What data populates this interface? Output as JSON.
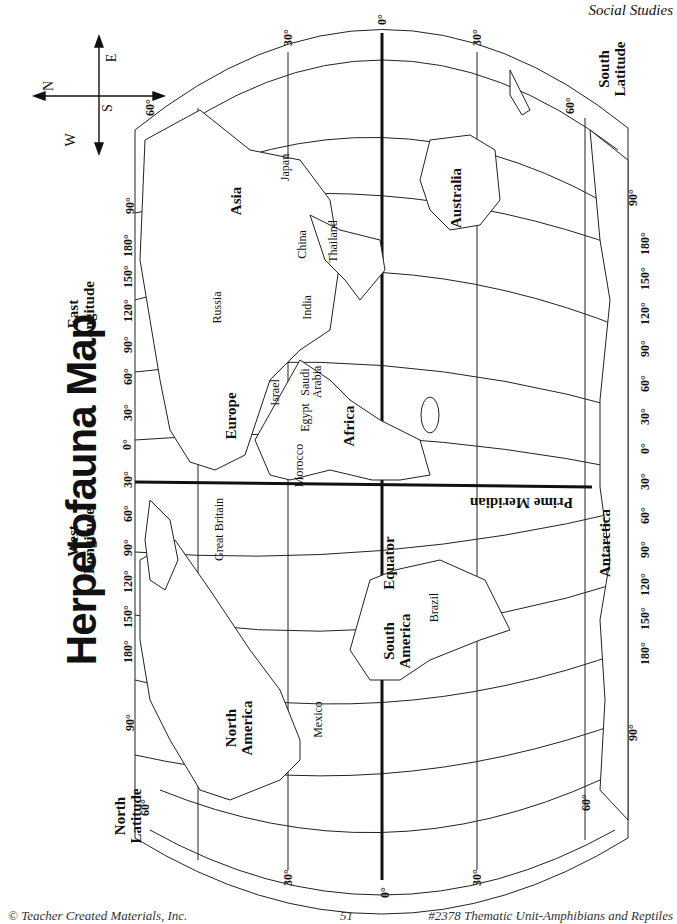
{
  "header": {
    "section": "Social Studies"
  },
  "title": "Herpetofauna Map",
  "compass": {
    "north": "N",
    "south": "S",
    "east": "E",
    "west": "W"
  },
  "axis_labels": {
    "east_longitude": [
      "East",
      "Longitude"
    ],
    "west_longitude": [
      "West",
      "Longitude"
    ],
    "north_latitude": [
      "North",
      "Latitude"
    ],
    "south_latitude": [
      "South",
      "Latitude"
    ]
  },
  "longitude_ticks_north_edge": [
    "180°",
    "150°",
    "120°",
    "90°",
    "60°",
    "30°",
    "0°",
    "30°",
    "60°",
    "90°",
    "120°",
    "150°",
    "180°"
  ],
  "longitude_ticks_south_edge": [
    "180°",
    "150°",
    "120°",
    "90°",
    "60°",
    "30°",
    "0°",
    "30°",
    "60°",
    "90°",
    "120°",
    "150°",
    "180°"
  ],
  "latitude_ticks_top": [
    "90°",
    "60°",
    "30°",
    "0°",
    "30°",
    "60°",
    "90°"
  ],
  "latitude_ticks_bottom": [
    "90°",
    "60°",
    "30°",
    "0°",
    "30°",
    "60°",
    "90°"
  ],
  "lines": {
    "equator": "Equator",
    "prime_meridian": "Prime Meridian"
  },
  "continents": {
    "asia": "Asia",
    "europe": "Europe",
    "africa": "Africa",
    "australia": "Australia",
    "antarctica": "Antarctica",
    "north_america": [
      "North",
      "America"
    ],
    "south_america": [
      "South",
      "America"
    ]
  },
  "countries": {
    "japan": "Japan",
    "china": "China",
    "thailand": "Thailand",
    "russia": "Russia",
    "india": "India",
    "saudi_arabia": [
      "Saudi",
      "Arabia"
    ],
    "israel": "Israel",
    "egypt": "Egypt",
    "morocco": "Morocco",
    "great_britain": "Great Britain",
    "mexico": "Mexico",
    "brazil": "Brazil"
  },
  "footer": {
    "copyright": "© Teacher Created Materials, Inc.",
    "page_number": "51",
    "book": "#2378 Thematic Unit-Amphibians and Reptiles"
  }
}
